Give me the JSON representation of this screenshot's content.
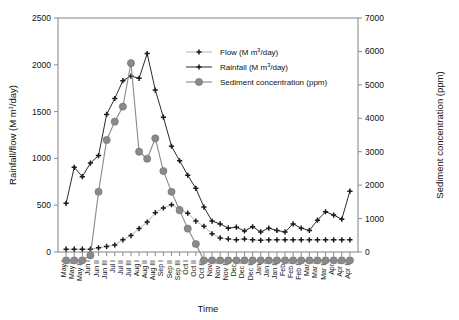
{
  "chart_data": {
    "type": "line",
    "title": "",
    "xlabel": "Time",
    "ylabel": "Rainfall/flow (M m3/day)",
    "ylabel_parts": {
      "main": "Rainfall/flow (M m",
      "sup": "3",
      "tail": "/day)"
    },
    "y2label": "Sediment concentration (ppm)",
    "ylim": [
      0,
      2500
    ],
    "y2lim": [
      0,
      7000
    ],
    "yticks": [
      0,
      500,
      1000,
      1500,
      2000,
      2500
    ],
    "y2ticks": [
      0,
      1000,
      2000,
      3000,
      4000,
      5000,
      6000,
      7000
    ],
    "grid": false,
    "legend_position": "top-right-inside",
    "categories": [
      "May I",
      "May II",
      "May III",
      "Jun I",
      "Jun II",
      "Jun III",
      "Jul I",
      "Jul II",
      "Jul III",
      "Aug I",
      "Aug II",
      "Aug III",
      "Sep I",
      "Sep II",
      "Sep III",
      "Oct I",
      "Oct II",
      "Oct III",
      "Nov I",
      "Nov II",
      "Nov III",
      "Dec I",
      "Dec II",
      "Dec III",
      "Jan I",
      "Jan II",
      "Jan III",
      "Feb I",
      "Feb II",
      "Feb III",
      "Mar I",
      "Mar II",
      "Mar III",
      "Apr I",
      "Apr II",
      "Apr III"
    ],
    "series": [
      {
        "name": "Flow (M m3/day)",
        "label_parts": {
          "main": "Flow (M m",
          "sup": "3",
          "tail": "/day)"
        },
        "axis": "left",
        "marker": "plus",
        "color": "#1a1a1a",
        "line_color": "#b5b5b5",
        "values": [
          30,
          30,
          30,
          30,
          45,
          60,
          75,
          130,
          175,
          250,
          320,
          420,
          470,
          505,
          460,
          415,
          330,
          275,
          195,
          150,
          140,
          130,
          140,
          130,
          125,
          130,
          130,
          130,
          130,
          130,
          130,
          130,
          130,
          130,
          130,
          130
        ]
      },
      {
        "name": "Rainfall (M m3/day)",
        "label_parts": {
          "main": "Rainfall (M m",
          "sup": "3",
          "tail": "/day)"
        },
        "axis": "left",
        "marker": "plus",
        "color": "#1a1a1a",
        "line_color": "#2b2b2b",
        "values": [
          520,
          905,
          805,
          950,
          1030,
          1470,
          1640,
          1830,
          1880,
          1855,
          2120,
          1730,
          1440,
          1130,
          975,
          820,
          680,
          480,
          330,
          300,
          255,
          265,
          225,
          270,
          215,
          255,
          230,
          215,
          300,
          255,
          230,
          340,
          430,
          395,
          350,
          650
        ]
      },
      {
        "name": "Sediment concentration (ppm)",
        "axis": "right",
        "marker": "circle",
        "color": "#8a8a8a",
        "line_color": "#8a8a8a",
        "values": [
          -250,
          -250,
          -250,
          -100,
          1800,
          3350,
          3900,
          4350,
          5650,
          3000,
          2790,
          3400,
          2420,
          1800,
          1250,
          700,
          240,
          -250,
          -250,
          -250,
          -250,
          -250,
          -250,
          -250,
          -250,
          -250,
          -250,
          -250,
          -250,
          -250,
          -250,
          -250,
          -250,
          -250,
          -250,
          -250
        ]
      }
    ],
    "legend": [
      {
        "name": "Flow (M m3/day)"
      },
      {
        "name": "Rainfall (M m3/day)"
      },
      {
        "name": "Sediment concentration (ppm)"
      }
    ]
  },
  "colors": {
    "axis": "#8c8c8c",
    "flow_line": "#b5b5b5",
    "rainfall_line": "#2b2b2b",
    "sediment": "#8a8a8a",
    "marker": "#1a1a1a",
    "text": "#111111",
    "background": "#ffffff"
  }
}
